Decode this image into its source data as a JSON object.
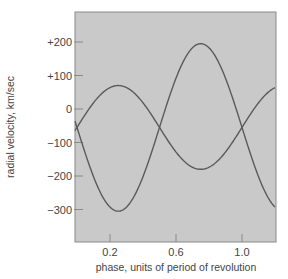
{
  "chart_data": {
    "type": "line",
    "title": "",
    "xlabel": "phase, units of period of revolution",
    "ylabel": "radial velocity, km/sec",
    "xlim": [
      0.0,
      1.2
    ],
    "ylim": [
      -400,
      300
    ],
    "grid": false,
    "legend": null,
    "x_ticks": [
      {
        "value": 0.2,
        "label": "0.2"
      },
      {
        "value": 0.6,
        "label": "0.6"
      },
      {
        "value": 1.0,
        "label": "1.0"
      }
    ],
    "y_ticks": [
      {
        "value": 200,
        "label": "+200"
      },
      {
        "value": 100,
        "label": "+100"
      },
      {
        "value": 0,
        "label": "0"
      },
      {
        "value": -100,
        "label": "−100"
      },
      {
        "value": -200,
        "label": "−200"
      },
      {
        "value": -300,
        "label": "−300"
      }
    ],
    "series": [
      {
        "name": "star A (smaller amplitude)",
        "x": [
          0.0,
          0.1,
          0.2,
          0.25,
          0.3,
          0.4,
          0.5,
          0.6,
          0.7,
          0.75,
          0.8,
          0.9,
          1.0,
          1.1,
          1.2
        ],
        "values": [
          -55,
          18,
          64,
          70,
          64,
          18,
          -55,
          -128,
          -174,
          -180,
          -174,
          -128,
          -55,
          18,
          64
        ]
      },
      {
        "name": "star B (larger amplitude)",
        "x": [
          0.0,
          0.1,
          0.2,
          0.25,
          0.3,
          0.4,
          0.5,
          0.6,
          0.7,
          0.75,
          0.8,
          0.9,
          1.0,
          1.1,
          1.2
        ],
        "values": [
          -55,
          -202,
          -293,
          -305,
          -293,
          -202,
          -55,
          92,
          183,
          195,
          183,
          92,
          -55,
          -202,
          -293
        ]
      }
    ],
    "colors": {
      "plot_background": "#c9c9c9",
      "line": "#5a5a5a",
      "frame": "#8a8a8a",
      "text": "#444444"
    }
  }
}
